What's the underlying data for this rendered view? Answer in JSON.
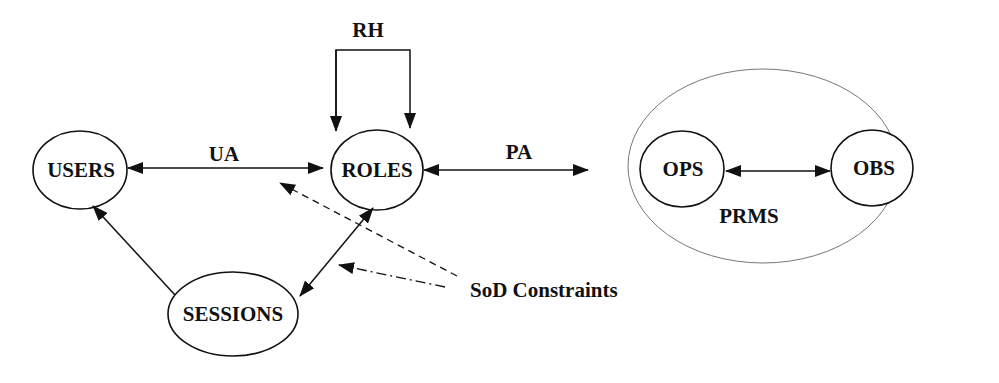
{
  "diagram": {
    "colors": {
      "background": "#ffffff",
      "stroke": "#111111",
      "container_stroke": "#777777"
    },
    "nodes": {
      "users": "USERS",
      "roles": "ROLES",
      "sessions": "SESSIONS",
      "ops": "OPS",
      "obs": "OBS"
    },
    "container": {
      "label": "PRMS"
    },
    "edges": {
      "ua": "UA",
      "pa": "PA",
      "rh": "RH"
    },
    "annotation": "SoD Constraints"
  }
}
